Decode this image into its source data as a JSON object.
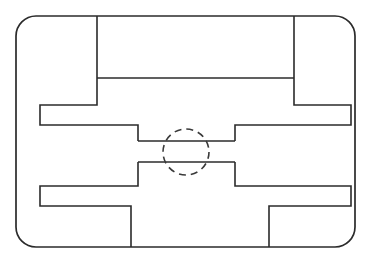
{
  "document": {
    "title": "Technical Line Diagram",
    "type": "line-drawing",
    "description": "Mirror-symmetric maze-like schematic outline with dashed circular callout at center",
    "canvas": {
      "width": 371,
      "height": 261,
      "background_color": "#ffffff"
    }
  },
  "style": {
    "line_color": "#2b2b2b",
    "dashed_color": "#3a3a3a",
    "line_width": 1.6,
    "border_width": 1.7,
    "dash_pattern": "7 5",
    "fill": "none"
  },
  "geometry": {
    "outer_border": {
      "name": "rounded-rectangle",
      "x": 16,
      "y": 16,
      "width": 339,
      "height": 231,
      "corner_radius": 20
    },
    "callout_circle": {
      "name": "dashed-circle",
      "center_x": 186,
      "center_y": 152,
      "radius": 23
    },
    "top_left_channel": "M 97 16 L 97 105 L 40 105 L 40 125 L 138 125 L 138 141",
    "top_right_channel": "M 294 16 L 294 105 L 351 105 L 351 125 L 235 125 L 235 141",
    "top_divider": "M 97 78 L 294 78",
    "mid_left_arm": "M 138 141 L 186 141",
    "mid_right_arm": "M 235 141 L 186 141",
    "low_left_arm": "M 138 162 L 186 162",
    "low_right_arm": "M 235 162 L 186 162",
    "bottom_left_channel": "M 138 162 L 138 186 L 40 186 L 40 206 L 131 206 L 131 247",
    "bottom_right_channel": "M 235 162 L 235 186 L 351 186 L 351 206 L 269 206 L 269 247"
  },
  "elements": [
    {
      "id": "outer-border",
      "label": "Outer rounded boundary",
      "shape": "rounded-rect"
    },
    {
      "id": "top-partition",
      "label": "Top horizontal divider",
      "shape": "line"
    },
    {
      "id": "left-step",
      "label": "Left stepped channel",
      "shape": "polyline"
    },
    {
      "id": "right-step",
      "label": "Right stepped channel",
      "shape": "polyline"
    },
    {
      "id": "center-circle",
      "label": "Dashed circular callout",
      "shape": "circle"
    },
    {
      "id": "bottom-left-step",
      "label": "Bottom left stepped channel",
      "shape": "polyline"
    },
    {
      "id": "bottom-right-step",
      "label": "Bottom right stepped channel",
      "shape": "polyline"
    }
  ]
}
